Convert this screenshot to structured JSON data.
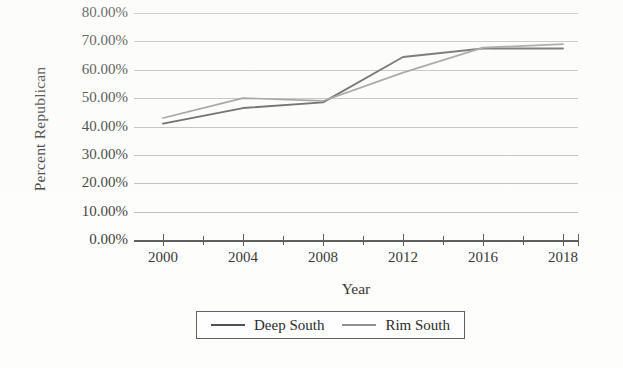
{
  "chart_data": {
    "type": "line",
    "title": "",
    "xlabel": "Year",
    "ylabel": "Percent Republican",
    "x": [
      2000,
      2004,
      2008,
      2012,
      2016,
      2018
    ],
    "xtick_labels": [
      "2000",
      "2004",
      "2008",
      "2012",
      "2016",
      "2018"
    ],
    "ytick_labels": [
      "80.00%",
      "70.00%",
      "60.00%",
      "50.00%",
      "40.00%",
      "30.00%",
      "20.00%",
      "10.00%",
      "0.00%"
    ],
    "ytick_values": [
      80,
      70,
      60,
      50,
      40,
      30,
      20,
      10,
      0
    ],
    "ylim": [
      0,
      80
    ],
    "yunit": "%",
    "grid": "horizontal",
    "legend_position": "bottom",
    "series": [
      {
        "name": "Deep South",
        "color": "#4a4a4a",
        "values": [
          41.0,
          46.5,
          48.5,
          64.5,
          67.5,
          67.5
        ]
      },
      {
        "name": "Rim South",
        "color": "#8c8c8c",
        "values": [
          43.0,
          50.0,
          49.0,
          59.0,
          67.8,
          69.0
        ]
      }
    ]
  },
  "axes": {
    "y_title": "Percent Republican",
    "x_title": "Year"
  },
  "legend": {
    "items": [
      {
        "label": "Deep South",
        "color": "#4a4a4a"
      },
      {
        "label": "Rim South",
        "color": "#8c8c8c"
      }
    ]
  },
  "colors": {
    "gridline": "#b9b9b4",
    "axis": "#4a4a4a",
    "text": "#232323",
    "background": "#fdfdfc"
  }
}
